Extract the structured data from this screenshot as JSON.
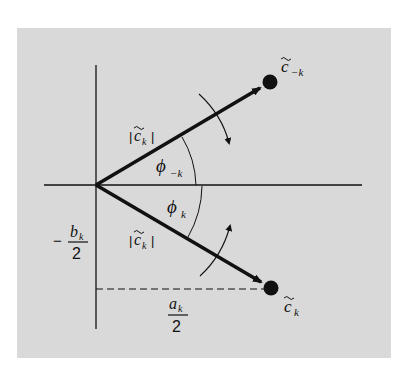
{
  "figure": {
    "background_color": "#d9d9d9",
    "ink_color": "#111111",
    "panel": {
      "x": 17,
      "y": 28,
      "width": 374,
      "height": 330
    }
  },
  "axes": {
    "origin": {
      "x": 96,
      "y": 185
    },
    "horizontal": {
      "x1": 44,
      "x2": 362
    },
    "vertical": {
      "y1": 65,
      "y2": 329
    }
  },
  "vectors": {
    "upper": {
      "label": "c̃₋ₖ",
      "tip": {
        "x": 270,
        "y": 82
      },
      "magnitude_label": "|c̃ₖ|"
    },
    "lower": {
      "label": "c̃ₖ",
      "tip": {
        "x": 271,
        "y": 288
      },
      "magnitude_label": "|c̃ₖ|"
    }
  },
  "labels": {
    "c_minus_k": {
      "base": "c",
      "sub": "−k"
    },
    "c_k": {
      "base": "c",
      "sub": "k"
    },
    "mag_upper": {
      "open": "|",
      "base": "c",
      "sub": "k",
      "close": "|"
    },
    "mag_lower": {
      "open": "|",
      "base": "c",
      "sub": "k",
      "close": "|"
    },
    "phi_minus_k": {
      "base": "ϕ",
      "sub": "−k"
    },
    "phi_k": {
      "base": "ϕ",
      "sub": "k"
    },
    "neg_b_half": {
      "sign": "−",
      "numerator": "b",
      "numerator_sub": "k",
      "denominator": "2"
    },
    "a_half": {
      "numerator": "a",
      "numerator_sub": "k",
      "denominator": "2"
    }
  },
  "rotation_arrows": {
    "upper": {
      "direction": "clockwise"
    },
    "lower": {
      "direction": "counter-clockwise"
    }
  }
}
